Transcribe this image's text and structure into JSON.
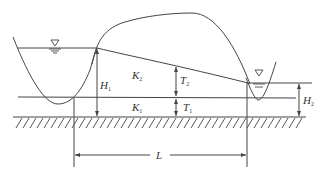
{
  "diagram": {
    "type": "seepage cross-section between two channels",
    "colors": {
      "line": "#444444",
      "background": "#ffffff"
    },
    "labels": {
      "K2": {
        "main": "K",
        "sub": "2"
      },
      "K1": {
        "main": "K",
        "sub": "1"
      },
      "H1": {
        "main": "H",
        "sub": "1"
      },
      "H2": {
        "main": "H",
        "sub": "2"
      },
      "T2": {
        "main": "T",
        "sub": "2"
      },
      "T1": {
        "main": "T",
        "sub": "1"
      },
      "L": {
        "main": "L"
      }
    },
    "symbols": {
      "left_water_level": "water-level-triangle",
      "right_water_level": "water-level-triangle"
    }
  }
}
